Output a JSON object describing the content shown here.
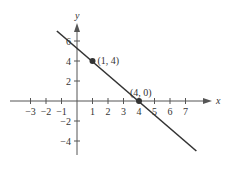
{
  "chart_data": {
    "type": "line",
    "title": "",
    "xlabel": "x",
    "ylabel": "y",
    "xlim": [
      -3.5,
      7.8
    ],
    "ylim": [
      -5.5,
      7
    ],
    "x_ticks": [
      "-3",
      "-2",
      "-1",
      "1",
      "2",
      "3",
      "4",
      "5",
      "6",
      "7"
    ],
    "y_ticks": [
      "6",
      "4",
      "2",
      "-2",
      "-4"
    ],
    "grid": false,
    "series": [
      {
        "name": "line",
        "x": [
          -1.3,
          7.7
        ],
        "y": [
          7.0,
          -5.0
        ],
        "color": "#333333"
      }
    ],
    "points": [
      {
        "x": 1,
        "y": 4,
        "label": "(1, 4)"
      },
      {
        "x": 4,
        "y": 0,
        "label": "(4, 0)"
      }
    ]
  }
}
